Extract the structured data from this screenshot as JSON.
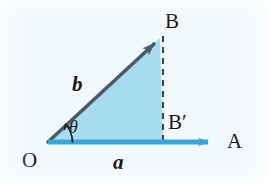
{
  "figure": {
    "background_color": "#f2f9fc"
  },
  "colors": {
    "triangle_fill": "#a7dcf0",
    "horizontal_vector": "#3aa4dd",
    "diagonal_vector": "#4b5a66",
    "dashed_line": "#3a4650",
    "label_text": "#161616"
  },
  "points": {
    "origin": {
      "label": "O",
      "x": 48,
      "y": 142
    },
    "tip_b": {
      "label": "B",
      "x": 160,
      "y": 38
    },
    "foot": {
      "label": "B′",
      "x": 163,
      "y": 142
    },
    "tip_a": {
      "label": "A",
      "x": 218,
      "y": 142
    }
  },
  "vectors": {
    "a": {
      "label": "a",
      "style": "italic-bold",
      "color": "#3aa4dd",
      "from": {
        "x": 48,
        "y": 142
      },
      "to": {
        "x": 218,
        "y": 142
      }
    },
    "b": {
      "label": "b",
      "style": "italic-bold",
      "color": "#4b5a66",
      "from": {
        "x": 48,
        "y": 142
      },
      "to": {
        "x": 160,
        "y": 38
      }
    }
  },
  "angle": {
    "label": "θ",
    "vertex": {
      "x": 48,
      "y": 142
    },
    "radius": 26
  },
  "dashed_projection": {
    "from": {
      "x": 163,
      "y": 38
    },
    "to": {
      "x": 163,
      "y": 142
    },
    "dash_pattern": "6 5"
  }
}
